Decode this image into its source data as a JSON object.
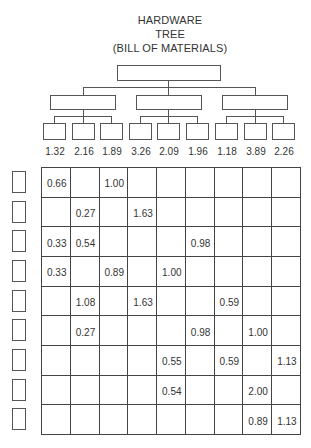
{
  "title": {
    "line1": "HARDWARE",
    "line2": "TREE",
    "line3": "(BILL OF MATERIALS)"
  },
  "tree": {
    "root": {
      "label": ""
    },
    "assemblies": [
      {
        "label": ""
      },
      {
        "label": ""
      },
      {
        "label": ""
      }
    ],
    "components": [
      {
        "value": "1.32"
      },
      {
        "value": "2.16"
      },
      {
        "value": "1.89"
      },
      {
        "value": "3.26"
      },
      {
        "value": "2.09"
      },
      {
        "value": "1.96"
      },
      {
        "value": "1.18"
      },
      {
        "value": "3.89"
      },
      {
        "value": "2.26"
      }
    ]
  },
  "matrix": {
    "rows": [
      {
        "header": "",
        "cells": [
          "0.66",
          "",
          "1.00",
          "",
          "",
          "",
          "",
          "",
          ""
        ]
      },
      {
        "header": "",
        "cells": [
          "",
          "0.27",
          "",
          "1.63",
          "",
          "",
          "",
          "",
          ""
        ]
      },
      {
        "header": "",
        "cells": [
          "0.33",
          "0.54",
          "",
          "",
          "",
          "0.98",
          "",
          "",
          ""
        ]
      },
      {
        "header": "",
        "cells": [
          "0.33",
          "",
          "0.89",
          "",
          "1.00",
          "",
          "",
          "",
          ""
        ]
      },
      {
        "header": "",
        "cells": [
          "",
          "1.08",
          "",
          "1.63",
          "",
          "",
          "0.59",
          "",
          ""
        ]
      },
      {
        "header": "",
        "cells": [
          "",
          "0.27",
          "",
          "",
          "",
          "0.98",
          "",
          "1.00",
          ""
        ]
      },
      {
        "header": "",
        "cells": [
          "",
          "",
          "",
          "",
          "0.55",
          "",
          "0.59",
          "",
          "1.13"
        ]
      },
      {
        "header": "",
        "cells": [
          "",
          "",
          "",
          "",
          "0.54",
          "",
          "",
          "2.00",
          ""
        ]
      },
      {
        "header": "",
        "cells": [
          "",
          "",
          "",
          "",
          "",
          "",
          "",
          "0.89",
          "1.13"
        ]
      }
    ]
  },
  "colors": {
    "line": "#555555",
    "text": "#333333",
    "background": "#ffffff"
  }
}
